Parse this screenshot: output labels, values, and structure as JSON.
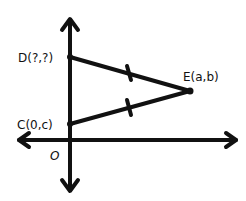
{
  "diagram": {
    "type": "coordinate-geometry",
    "axes": {
      "origin_label": "O",
      "color": "#111111"
    },
    "points": [
      {
        "id": "D",
        "label": "D(?,?)"
      },
      {
        "id": "C",
        "label": "C(0,c)"
      },
      {
        "id": "E",
        "label": "E(a,b)"
      }
    ],
    "segments": [
      {
        "from": "D",
        "to": "E",
        "tick_marks": 1
      },
      {
        "from": "C",
        "to": "E",
        "tick_marks": 1
      }
    ],
    "note": "DE and CE are marked as congruent"
  }
}
